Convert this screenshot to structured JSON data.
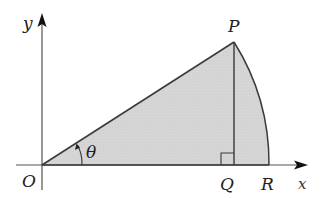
{
  "diagram": {
    "type": "geometry-sector",
    "colors": {
      "fill": "#d4d4d4",
      "stroke": "#3a3a3a",
      "axis": "#555555",
      "label": "#222222"
    },
    "axes": {
      "x_label": "x",
      "y_label": "y",
      "origin_label": "O"
    },
    "points": {
      "P": {
        "label": "P"
      },
      "Q": {
        "label": "Q"
      },
      "R": {
        "label": "R"
      }
    },
    "angle": {
      "label": "θ"
    },
    "right_angle_marker_at": "Q"
  }
}
